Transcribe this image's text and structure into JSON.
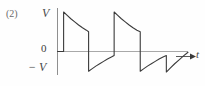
{
  "figure": {
    "item_number": "(2)",
    "y_axis_top_label": "V",
    "y_axis_zero_label": "0",
    "y_axis_bottom_label": "− V",
    "x_axis_label": "t",
    "axis_color": "#9a9a9a",
    "curve_color": "#3a3a3a",
    "background_color": "#fefefe"
  },
  "chart_data": {
    "type": "line",
    "title": "",
    "xlabel": "t",
    "ylabel": "V",
    "grid": false,
    "legend": null,
    "ylim": [
      -1,
      1
    ],
    "ytick_values": [
      1,
      0,
      -1
    ],
    "ytick_labels": [
      "V",
      "0",
      "− V"
    ],
    "xlim": [
      0,
      2.35
    ],
    "period": 1.0,
    "amplitude": 1.0,
    "series": [
      {
        "name": "v(t)",
        "x": [
          0.0,
          0.11,
          0.11,
          0.17,
          0.24,
          0.31,
          0.38,
          0.45,
          0.52,
          0.56,
          0.56,
          0.62,
          0.69,
          0.76,
          0.83,
          0.9,
          0.97,
          1.02,
          1.02,
          1.08,
          1.15,
          1.22,
          1.29,
          1.36,
          1.43,
          1.49,
          1.49,
          1.55,
          1.62,
          1.69,
          1.76,
          1.83,
          1.9,
          1.96,
          1.96,
          2.03,
          2.11,
          2.19,
          2.27,
          2.35
        ],
        "y": [
          0.0,
          0.0,
          1.0,
          0.92,
          0.83,
          0.75,
          0.67,
          0.6,
          0.54,
          0.5,
          -0.5,
          -0.44,
          -0.37,
          -0.31,
          -0.25,
          -0.19,
          -0.14,
          -0.1,
          1.0,
          0.92,
          0.83,
          0.75,
          0.67,
          0.6,
          0.54,
          0.5,
          -0.5,
          -0.44,
          -0.37,
          -0.31,
          -0.25,
          -0.19,
          -0.14,
          -0.1,
          -0.52,
          -0.42,
          -0.31,
          -0.21,
          -0.11,
          -0.02
        ]
      }
    ]
  }
}
